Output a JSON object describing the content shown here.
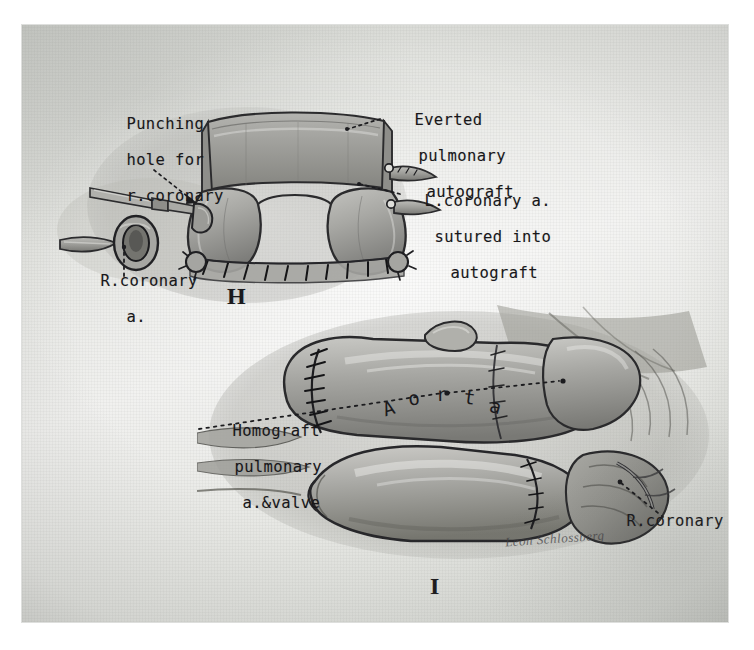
{
  "figure": {
    "medium": "pencil-and-wash surgical illustration photographed on textured paper",
    "paper_color": "#e3e4e0",
    "ink_color": "#18171a"
  },
  "panels": [
    {
      "id": "panel-h",
      "letter": "H",
      "annotations": [
        {
          "id": "punching-hole",
          "lines": [
            "Punching",
            "hole for",
            "r.coronary"
          ]
        },
        {
          "id": "everted-autograft",
          "lines": [
            "Everted",
            "pulmonary",
            "autograft"
          ]
        },
        {
          "id": "l-coronary-sutured",
          "lines": [
            "L.coronary a.",
            "sutured into",
            "autograft"
          ]
        },
        {
          "id": "r-coronary-button",
          "lines": [
            "R.coronary",
            "a."
          ]
        }
      ]
    },
    {
      "id": "panel-i",
      "letter": "I",
      "annotations": [
        {
          "id": "homograft-pulmonary",
          "lines": [
            "Homograft",
            "pulmonary",
            "a.&valve"
          ]
        },
        {
          "id": "aorta",
          "lines": [
            "Aorta"
          ]
        },
        {
          "id": "r-coronary-artery",
          "lines": [
            "R.coronary a."
          ]
        }
      ],
      "signature": "Leon Schlossberg"
    }
  ],
  "colors": {
    "tissue_light": "#bcbcb8",
    "tissue_mid": "#9a9a96",
    "tissue_dark": "#6d6d6a",
    "outline": "#2a2a2c",
    "suture": "#141416"
  }
}
